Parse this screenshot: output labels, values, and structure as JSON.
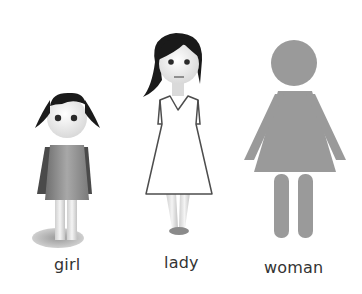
{
  "figures": [
    {
      "id": "girl",
      "label": "girl"
    },
    {
      "id": "lady",
      "label": "lady"
    },
    {
      "id": "woman",
      "label": "woman"
    }
  ],
  "colors": {
    "hair": "#1a1a1a",
    "skin": "#e9e9e9",
    "girl_dress": "#8a8a8a",
    "girl_dress_dark": "#4a4a4a",
    "lady_dress": "#ffffff",
    "lady_outline": "#4d4d4d",
    "pictogram": "#9a9a9a",
    "shadow": "#b5b5b5",
    "label_text": "#333333"
  }
}
